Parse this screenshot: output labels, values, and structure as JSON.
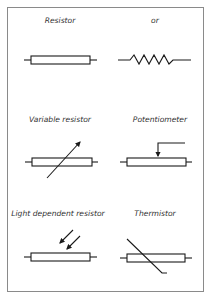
{
  "diagram": {
    "panels": [
      {
        "id": "resistor",
        "label": "Resistor"
      },
      {
        "id": "or",
        "label": "or"
      },
      {
        "id": "variable_resistor",
        "label": "Variable resistor"
      },
      {
        "id": "potentiometer",
        "label": "Potentiometer"
      },
      {
        "id": "ldr",
        "label": "Light dependent resistor"
      },
      {
        "id": "thermistor",
        "label": "Thermistor"
      }
    ],
    "colors": {
      "stroke": "#1a1a1a",
      "frame": "#8a8a8a",
      "text": "#333333"
    }
  }
}
